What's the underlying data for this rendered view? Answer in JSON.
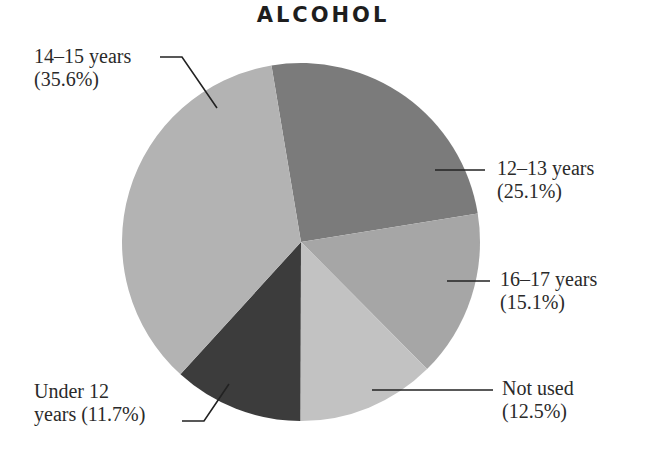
{
  "chart_data": {
    "type": "pie",
    "title": "ALCOHOL",
    "categories": [
      "12–13 years",
      "16–17 years",
      "Not used",
      "Under 12 years",
      "14–15 years"
    ],
    "values": [
      25.1,
      15.1,
      12.5,
      11.7,
      35.6
    ],
    "unit": "%",
    "colors": [
      "#7b7b7b",
      "#a6a6a6",
      "#c2c2c2",
      "#3c3c3c",
      "#b3b3b3"
    ],
    "start_angle_deg": -9.5,
    "direction": "clockwise",
    "legend": "none (leader-line labels)",
    "labels": [
      {
        "line1": "12–13 years",
        "line2": "(25.1%)"
      },
      {
        "line1": "16–17 years",
        "line2": "(15.1%)"
      },
      {
        "line1": "Not used",
        "line2": "(12.5%)"
      },
      {
        "line1": "Under 12",
        "line2": "years (11.7%)"
      },
      {
        "line1": "14–15 years",
        "line2": "(35.6%)"
      }
    ]
  }
}
